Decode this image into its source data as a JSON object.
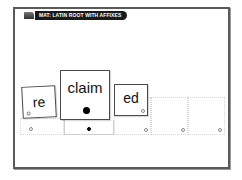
{
  "header": {
    "title": "MAT: LATIN ROOT WITH AFFIXES",
    "icon": "tab-icon"
  },
  "cards": [
    {
      "label": "re",
      "role": "prefix",
      "marker": "hollow"
    },
    {
      "label": "claim",
      "role": "root",
      "marker": "filled"
    },
    {
      "label": "ed",
      "role": "suffix",
      "marker": "hollow"
    }
  ],
  "slots": [
    {
      "index": 1,
      "marker": "hollow"
    },
    {
      "index": 2,
      "marker": "filled"
    },
    {
      "index": 3,
      "marker": "hollow"
    },
    {
      "index": 4,
      "marker": "hollow"
    },
    {
      "index": 5,
      "marker": "hollow"
    }
  ],
  "colors": {
    "frame_border": "#5a5a5a",
    "title_bg": "#1a1a1a",
    "title_text": "#ffffff",
    "card_border": "#4a4a4a"
  }
}
